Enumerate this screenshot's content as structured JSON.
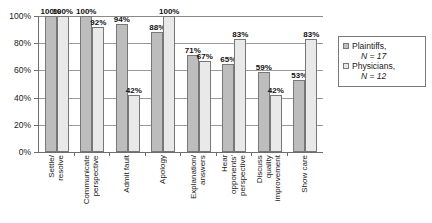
{
  "chart_data": {
    "type": "bar",
    "title": "",
    "subtitle": "",
    "xlabel": "",
    "ylabel": "",
    "ylim": [
      0,
      100
    ],
    "grid": true,
    "legend_position": "right",
    "y_ticks": [
      "0%",
      "20%",
      "40%",
      "60%",
      "80%",
      "100%"
    ],
    "y_tick_values": [
      0,
      20,
      40,
      60,
      80,
      100
    ],
    "categories": [
      "Settle/\nresolve",
      "Communicate\nperspective",
      "Admit fault",
      "Apology",
      "Explanation/\nanswers",
      "Hear\nopponents'\nperspective",
      "Discuss\nquality\nimprovement",
      "Show care"
    ],
    "series": [
      {
        "name": "Plaintiffs",
        "n": 17,
        "color": "#bdbdbd",
        "values": [
          100,
          100,
          94,
          88,
          71,
          65,
          59,
          53
        ],
        "labels": [
          "100%",
          "100%",
          "94%",
          "88%",
          "71%",
          "65%",
          "59%",
          "53%"
        ]
      },
      {
        "name": "Physicians",
        "n": 12,
        "color": "#e9e9e9",
        "values": [
          100,
          92,
          42,
          100,
          67,
          83,
          42,
          83
        ],
        "labels": [
          "100%",
          "92%",
          "42%",
          "100%",
          "67%",
          "83%",
          "42%",
          "83%"
        ]
      }
    ]
  },
  "legend": {
    "entries": [
      {
        "label": "Plaintiffs,",
        "n_text": "N = 17",
        "n_symbol": "N",
        "n_value": "= 17"
      },
      {
        "label": "Physicians,",
        "n_text": "N = 12",
        "n_symbol": "N",
        "n_value": "= 12"
      }
    ]
  }
}
